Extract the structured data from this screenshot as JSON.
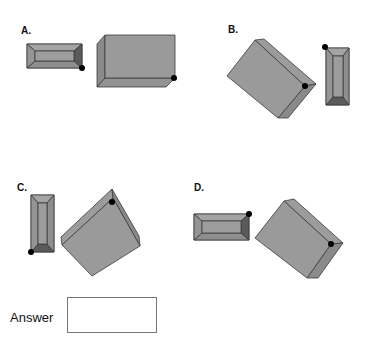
{
  "options": [
    {
      "id": "A",
      "label": "A."
    },
    {
      "id": "B",
      "label": "B."
    },
    {
      "id": "C",
      "label": "C."
    },
    {
      "id": "D",
      "label": "D."
    }
  ],
  "answer": {
    "label": "Answer",
    "value": ""
  },
  "colors": {
    "face": "#9a9a9a",
    "side": "#8a8a8a",
    "dark_bevel": "#5a5a5a",
    "edge": "#3a3a3a",
    "dot": "#000000"
  }
}
